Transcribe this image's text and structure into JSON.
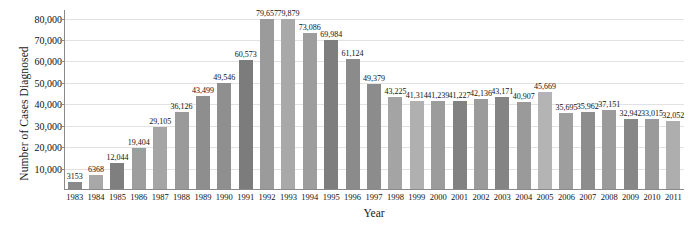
{
  "chart_data": {
    "type": "bar",
    "title": "",
    "xlabel": "Year",
    "ylabel": "Number of Cases Diagnosed",
    "ylim": [
      0,
      84000
    ],
    "ytick_labels": [
      "10,000",
      "20,000",
      "30,000",
      "40,000",
      "50,000",
      "60,000",
      "70,000",
      "80,000"
    ],
    "ytick_values": [
      10000,
      20000,
      30000,
      40000,
      50000,
      60000,
      70000,
      80000
    ],
    "grid": true,
    "legend": "none",
    "categories": [
      "1983",
      "1984",
      "1985",
      "1986",
      "1987",
      "1988",
      "1989",
      "1990",
      "1991",
      "1992",
      "1993",
      "1994",
      "1995",
      "1996",
      "1997",
      "1998",
      "1999",
      "2000",
      "2001",
      "2002",
      "2003",
      "2004",
      "2005",
      "2006",
      "2007",
      "2008",
      "2009",
      "2010",
      "2011"
    ],
    "values": [
      3153,
      6368,
      12044,
      19404,
      29105,
      36126,
      43499,
      49546,
      60573,
      79657,
      79879,
      73086,
      69984,
      61124,
      49379,
      43225,
      41314,
      41239,
      41227,
      42136,
      43171,
      40907,
      45669,
      35695,
      35962,
      37151,
      32942,
      33015,
      32052
    ],
    "value_labels": [
      "3153",
      "6368",
      "12,044",
      "19,404",
      "29,105",
      "36,126",
      "43,499",
      "49,546",
      "60,573",
      "79,657",
      "79,879",
      "73,086",
      "69,984",
      "61,124",
      "49,379",
      "43,225",
      "41,314",
      "41,239",
      "41,227",
      "42,136",
      "43,171",
      "40,907",
      "45,669",
      "35,695",
      "35,962",
      "37,151",
      "32,942",
      "33,015",
      "32,052"
    ],
    "bar_colors": [
      "#8a8a8a",
      "#a8a8a8",
      "#7f7f7f",
      "#9e9e9e",
      "#a5a5a5",
      "#9a9a9a",
      "#8e8e8e",
      "#8f8f8f",
      "#7c7c7c",
      "#9b9b9b",
      "#a9a9a9",
      "#9d9d9d",
      "#7e7e7e",
      "#8b8b8b",
      "#8c8c8c",
      "#a4a4a4",
      "#b0b0b0",
      "#9c9c9c",
      "#828282",
      "#9b9b9b",
      "#848484",
      "#9a9a9a",
      "#b4b4b4",
      "#9e9e9e",
      "#8d8d8d",
      "#9b9b9b",
      "#878787",
      "#9a9a9a",
      "#aeaeae"
    ],
    "colors": {
      "bar_dark": "#808080",
      "bar_light": "#ababab",
      "axis": "#8a8a8a",
      "gridline": "#e2e2e2",
      "text": "#111111",
      "background": "#ffffff"
    }
  }
}
